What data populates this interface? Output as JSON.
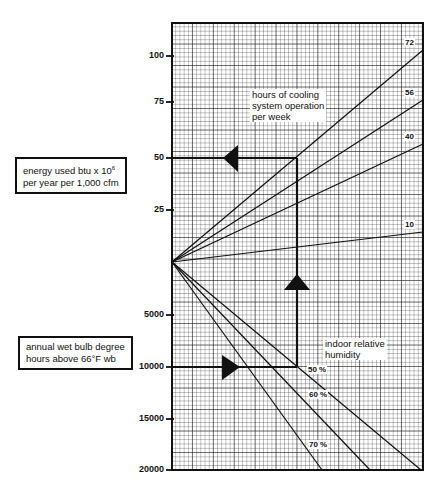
{
  "chart_data": {
    "type": "line",
    "title": "",
    "upper_panel": {
      "ylabel": "energy used btu x 10^6 per year per 1,000 cfm",
      "tick_labels": [
        "100",
        "75",
        "50",
        "25"
      ],
      "ticks": [
        100,
        75,
        50,
        25
      ],
      "ylim": [
        0,
        110
      ],
      "legend_title": "hours of cooling system operation per week",
      "series": [
        {
          "name": "72",
          "end_value": 103
        },
        {
          "name": "56",
          "end_value": 78
        },
        {
          "name": "40",
          "end_value": 57
        },
        {
          "name": "10",
          "end_value": 14
        }
      ]
    },
    "lower_panel": {
      "ylabel": "annual wet bulb degree hours above 66°F wb",
      "tick_labels": [
        "5000",
        "10000",
        "15000",
        "20000"
      ],
      "ticks": [
        5000,
        10000,
        15000,
        20000
      ],
      "ylim": [
        0,
        20000
      ],
      "legend_title": "indoor relative humidity",
      "series": [
        {
          "name": "50 %",
          "end_at_20000_fraction_of_width": 0.99
        },
        {
          "name": "60 %",
          "end_at_20000_fraction_of_width": 0.79
        },
        {
          "name": "70 %",
          "end_at_20000_fraction_of_width": 0.6
        }
      ]
    },
    "example_path": {
      "start": "10000 wet bulb degree hours",
      "via": "50 % relative humidity, 72 hours/week",
      "result": "50 btu x 10^6"
    },
    "grid": true
  },
  "labels": {
    "energy_box_line1": "energy used btu x 10",
    "energy_box_sup": "6",
    "energy_box_line2": "per year per 1,000 cfm",
    "wb_box_line1": "annual wet bulb degree",
    "wb_box_line2": "hours above 66°F wb",
    "hours_note_1": "hours of cooling",
    "hours_note_2": "system operation",
    "hours_note_3": "per week",
    "rh_note_1": "indoor relative",
    "rh_note_2": "humidity"
  },
  "upper_ticks": [
    {
      "label": "100",
      "y": 56
    },
    {
      "label": "75",
      "y": 102
    },
    {
      "label": "50",
      "y": 158
    },
    {
      "label": "25",
      "y": 210
    }
  ],
  "lower_ticks": [
    {
      "label": "5000",
      "y": 315
    },
    {
      "label": "10000",
      "y": 367
    },
    {
      "label": "15000",
      "y": 419
    },
    {
      "label": "20000",
      "y": 470
    }
  ],
  "hour_lines": [
    {
      "label": "72",
      "y_end": 50
    },
    {
      "label": "56",
      "y_end": 100
    },
    {
      "label": "40",
      "y_end": 144
    },
    {
      "label": "10",
      "y_end": 232
    }
  ],
  "rh_lines": [
    {
      "label": "50 %",
      "x_end": 421
    },
    {
      "label": "60 %",
      "x_end": 370
    },
    {
      "label": "70 %",
      "x_end": 322
    }
  ]
}
